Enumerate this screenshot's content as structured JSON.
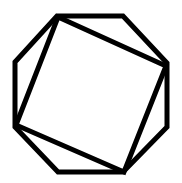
{
  "diagram": {
    "background": "#ffffff",
    "stroke_color": "#000000",
    "stroke_width": 5,
    "shapes": [
      {
        "name": "octagon",
        "points": [
          [
            57,
            16
          ],
          [
            123,
            16
          ],
          [
            167,
            63
          ],
          [
            167,
            127
          ],
          [
            123,
            172
          ],
          [
            58,
            172
          ],
          [
            15,
            127
          ],
          [
            15,
            62
          ]
        ]
      },
      {
        "name": "inscribed-square",
        "points": [
          [
            58,
            17
          ],
          [
            166,
            66
          ],
          [
            124,
            172
          ],
          [
            16,
            125
          ]
        ]
      }
    ]
  }
}
